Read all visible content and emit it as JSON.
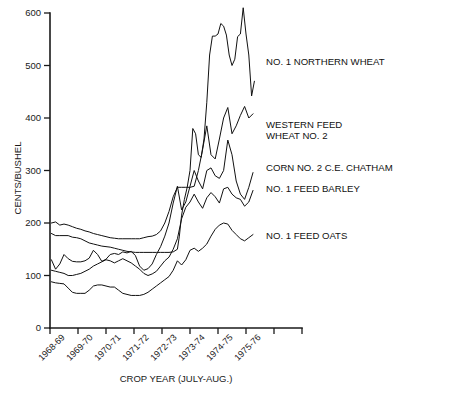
{
  "chart_data": {
    "type": "line",
    "title": "",
    "xlabel": "CROP YEAR (JULY-AUG.)",
    "ylabel": "CENTS/BUSHEL",
    "ylim": [
      0,
      600
    ],
    "yticks": [
      0,
      100,
      200,
      300,
      400,
      500,
      600
    ],
    "ytick_labels": [
      "0",
      "100",
      "200",
      "300",
      "400",
      "500",
      "600"
    ],
    "grid": false,
    "legend_position": "inline-right",
    "categories": [
      "1968-69",
      "1969-70",
      "1970-71",
      "1971-72",
      "1972-73",
      "1973-74",
      "1974-75",
      "1975-76"
    ],
    "xtick_labels": [
      "1968-69",
      "1969-70",
      "1970-71",
      "1971-72",
      "1972-73",
      "1973-74",
      "1974-75",
      "1975-76"
    ],
    "x_unit": "crop year (monthly observations)",
    "series": [
      {
        "name": "NO. 1 NORTHERN WHEAT",
        "label": "NO. 1 NORTHERN WHEAT",
        "label_y_value": 505,
        "x": [
          0.05,
          0.2,
          0.35,
          0.5,
          0.65,
          0.8,
          0.95,
          1.1,
          1.25,
          1.4,
          1.55,
          1.7,
          1.85,
          2.0,
          2.15,
          2.3,
          2.45,
          2.6,
          2.75,
          2.9,
          3.05,
          3.2,
          3.35,
          3.5,
          3.65,
          3.8,
          3.95,
          4.1,
          4.25,
          4.4,
          4.55,
          4.62,
          4.7,
          4.8,
          4.9,
          5.0,
          5.1,
          5.2,
          5.3,
          5.4,
          5.5,
          5.6,
          5.7,
          5.8,
          5.9,
          6.0,
          6.1,
          6.2,
          6.3,
          6.4,
          6.5,
          6.6,
          6.7,
          6.8,
          6.9,
          7.0,
          7.1,
          7.2,
          7.3
        ],
        "values": [
          180,
          176,
          176,
          176,
          176,
          173,
          172,
          170,
          166,
          162,
          160,
          158,
          156,
          155,
          154,
          152,
          150,
          148,
          146,
          145,
          144,
          144,
          144,
          144,
          144,
          144,
          144,
          144,
          144,
          145,
          150,
          175,
          215,
          245,
          268,
          300,
          380,
          370,
          330,
          325,
          360,
          430,
          520,
          556,
          556,
          560,
          580,
          575,
          558,
          520,
          500,
          512,
          555,
          560,
          610,
          560,
          520,
          442,
          470
        ]
      },
      {
        "name": "WESTERN FEED WHEAT NO. 2",
        "label": "WESTERN FEED WHEAT NO. 2",
        "label_y_value": 378,
        "label_line_2": "WHEAT NO. 2",
        "x": [
          0.05,
          0.2,
          0.35,
          0.5,
          0.65,
          0.8,
          0.95,
          1.1,
          1.25,
          1.4,
          1.55,
          1.7,
          1.85,
          2.0,
          2.15,
          2.3,
          2.45,
          2.6,
          2.75,
          2.9,
          3.05,
          3.2,
          3.35,
          3.5,
          3.65,
          3.8,
          3.95,
          4.1,
          4.25,
          4.4,
          4.55,
          4.7,
          4.85,
          5.0,
          5.15,
          5.3,
          5.45,
          5.6,
          5.75,
          5.9,
          6.05,
          6.2,
          6.35,
          6.5,
          6.65,
          6.8,
          6.95,
          7.1,
          7.25
        ],
        "values": [
          200,
          202,
          196,
          198,
          196,
          193,
          190,
          188,
          185,
          183,
          180,
          178,
          176,
          174,
          172,
          171,
          170,
          170,
          170,
          170,
          170,
          170,
          172,
          174,
          175,
          178,
          185,
          200,
          222,
          250,
          268,
          268,
          268,
          268,
          270,
          300,
          340,
          385,
          330,
          322,
          360,
          400,
          420,
          370,
          385,
          405,
          422,
          400,
          408
        ]
      },
      {
        "name": "CORN NO. 2 C.E. CHATHAM",
        "label": "CORN NO. 2 C.E. CHATHAM",
        "label_y_value": 303,
        "x": [
          0.05,
          0.2,
          0.35,
          0.5,
          0.65,
          0.8,
          0.95,
          1.1,
          1.25,
          1.4,
          1.55,
          1.7,
          1.85,
          2.0,
          2.15,
          2.3,
          2.45,
          2.6,
          2.75,
          2.9,
          3.05,
          3.2,
          3.35,
          3.5,
          3.65,
          3.8,
          3.95,
          4.1,
          4.25,
          4.4,
          4.55,
          4.7,
          4.85,
          5.0,
          5.15,
          5.3,
          5.45,
          5.6,
          5.75,
          5.9,
          6.05,
          6.2,
          6.35,
          6.5,
          6.65,
          6.8,
          6.95,
          7.1,
          7.25
        ],
        "values": [
          130,
          112,
          122,
          140,
          132,
          127,
          126,
          126,
          128,
          133,
          148,
          140,
          127,
          131,
          140,
          142,
          140,
          145,
          143,
          146,
          138,
          118,
          110,
          113,
          122,
          140,
          155,
          175,
          200,
          238,
          270,
          225,
          240,
          270,
          300,
          280,
          265,
          300,
          305,
          290,
          285,
          300,
          358,
          330,
          280,
          255,
          245,
          268,
          296
        ]
      },
      {
        "name": "NO. 1 FEED BARLEY",
        "label": "NO. 1 FEED BARLEY",
        "label_y_value": 263,
        "x": [
          0.05,
          0.2,
          0.35,
          0.5,
          0.65,
          0.8,
          0.95,
          1.1,
          1.25,
          1.4,
          1.55,
          1.7,
          1.85,
          2.0,
          2.15,
          2.3,
          2.45,
          2.6,
          2.75,
          2.9,
          3.05,
          3.2,
          3.35,
          3.5,
          3.65,
          3.8,
          3.95,
          4.1,
          4.25,
          4.4,
          4.55,
          4.7,
          4.85,
          5.0,
          5.15,
          5.3,
          5.45,
          5.6,
          5.75,
          5.9,
          6.05,
          6.2,
          6.35,
          6.5,
          6.65,
          6.8,
          6.95,
          7.1,
          7.25
        ],
        "values": [
          110,
          108,
          106,
          104,
          100,
          100,
          102,
          104,
          108,
          112,
          118,
          122,
          126,
          130,
          128,
          124,
          128,
          132,
          128,
          124,
          118,
          112,
          104,
          100,
          103,
          108,
          118,
          128,
          135,
          150,
          170,
          208,
          230,
          240,
          255,
          240,
          228,
          248,
          258,
          250,
          238,
          265,
          268,
          255,
          248,
          245,
          232,
          240,
          262
        ]
      },
      {
        "name": "NO. 1 FEED OATS",
        "label": "NO. 1 FEED OATS",
        "label_y_value": 175,
        "x": [
          0.05,
          0.2,
          0.35,
          0.5,
          0.65,
          0.8,
          0.95,
          1.1,
          1.25,
          1.4,
          1.55,
          1.7,
          1.85,
          2.0,
          2.15,
          2.3,
          2.45,
          2.6,
          2.75,
          2.9,
          3.05,
          3.2,
          3.35,
          3.5,
          3.65,
          3.8,
          3.95,
          4.1,
          4.25,
          4.4,
          4.55,
          4.7,
          4.85,
          5.0,
          5.15,
          5.3,
          5.45,
          5.6,
          5.75,
          5.9,
          6.05,
          6.2,
          6.35,
          6.5,
          6.65,
          6.8,
          6.95,
          7.1,
          7.25
        ],
        "values": [
          88,
          86,
          85,
          84,
          76,
          68,
          66,
          66,
          66,
          72,
          80,
          82,
          82,
          80,
          78,
          78,
          72,
          66,
          64,
          62,
          62,
          62,
          64,
          68,
          74,
          80,
          86,
          92,
          98,
          110,
          128,
          120,
          130,
          148,
          152,
          146,
          152,
          160,
          175,
          188,
          196,
          200,
          198,
          186,
          178,
          170,
          166,
          172,
          178
        ]
      }
    ],
    "series_labels": [
      "NO. 1 NORTHERN WHEAT",
      "WESTERN FEED",
      "WHEAT NO. 2",
      "CORN NO. 2 C.E. CHATHAM",
      "NO. 1 FEED BARLEY",
      "NO. 1 FEED OATS"
    ],
    "line_color": "#111111",
    "background_color": "#ffffff"
  }
}
